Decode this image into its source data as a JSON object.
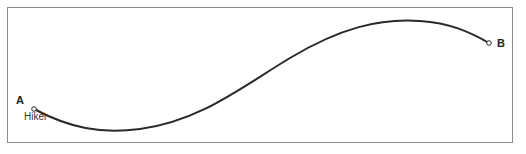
{
  "diagram": {
    "type": "path-profile",
    "frame": {
      "border_color": "#8a8a8a"
    },
    "path": {
      "stroke_color": "#2a2a2a",
      "start": {
        "label": "A",
        "sublabel": "Hiker",
        "x": 34,
        "y": 109
      },
      "end": {
        "label": "B",
        "x": 489,
        "y": 43
      },
      "trough": {
        "x": 115,
        "y": 131
      },
      "peak": {
        "x": 405,
        "y": 20
      }
    }
  }
}
